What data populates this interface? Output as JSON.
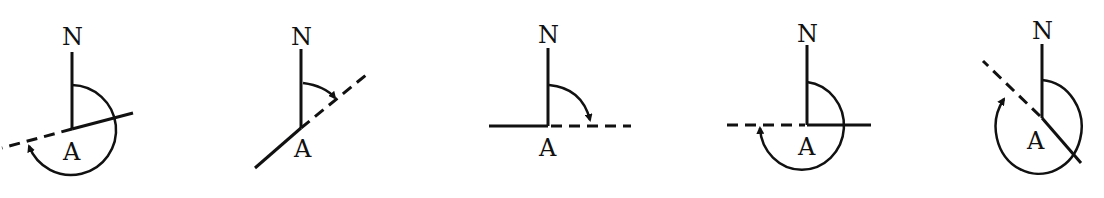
{
  "figure": {
    "diagrams": [
      {
        "id": 1,
        "north_label": "N",
        "point_label": "A",
        "bearing_note": "reflex angle, dashed direction toward WSW"
      },
      {
        "id": 2,
        "north_label": "N",
        "point_label": "A",
        "bearing_note": "acute angle, dashed direction toward NE"
      },
      {
        "id": 3,
        "north_label": "N",
        "point_label": "A",
        "bearing_note": "right angle, dashed direction toward E"
      },
      {
        "id": 4,
        "north_label": "N",
        "point_label": "A",
        "bearing_note": "reflex angle, dashed direction toward W"
      },
      {
        "id": 5,
        "north_label": "N",
        "point_label": "A",
        "bearing_note": "reflex angle, dashed direction toward NW"
      }
    ]
  },
  "colors": {
    "ink": "#111111",
    "background": "#ffffff"
  }
}
